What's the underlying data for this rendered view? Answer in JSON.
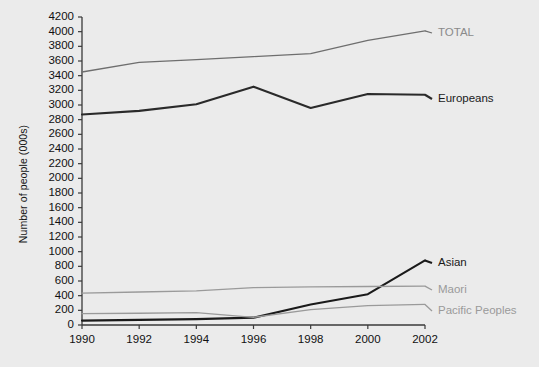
{
  "chart_data": {
    "type": "line",
    "title": "",
    "subtitle": "",
    "xlabel": "",
    "ylabel": "Number of people (000s)",
    "x": [
      1990,
      1991,
      1992,
      1993,
      1994,
      1995,
      1996,
      1997,
      1998,
      1999,
      2000,
      2001,
      2002
    ],
    "categories": [
      "1990",
      "1992",
      "1994",
      "1996",
      "1998",
      "2000",
      "2002"
    ],
    "xticks": [
      "1990",
      "1992",
      "1994",
      "1996",
      "1998",
      "2000",
      "2002"
    ],
    "yticks": [
      "0",
      "200",
      "400",
      "600",
      "800",
      "1000",
      "1200",
      "1400",
      "1600",
      "1800",
      "2000",
      "2200",
      "2400",
      "2600",
      "2800",
      "3000",
      "3200",
      "3400",
      "3600",
      "3800",
      "4000",
      "4200"
    ],
    "xlim": [
      1990,
      2002
    ],
    "ylim": [
      0,
      4200
    ],
    "grid": false,
    "legend_position": "right-inline-labels",
    "series": [
      {
        "name": "TOTAL",
        "color": "#6e6e6e",
        "label_color": "#8a8a8a",
        "x": [
          1990,
          1992,
          1994,
          1996,
          1998,
          2000,
          2002
        ],
        "values": [
          3450,
          3580,
          3620,
          3660,
          3700,
          3880,
          4010
        ]
      },
      {
        "name": "Europeans",
        "color": "#2a2a2a",
        "label_color": "#1a1a1a",
        "x": [
          1990,
          1992,
          1994,
          1996,
          1998,
          2000,
          2002
        ],
        "values": [
          2870,
          2920,
          3010,
          3250,
          2960,
          3150,
          3140
        ]
      },
      {
        "name": "Asian",
        "color": "#1a1a1a",
        "label_color": "#1a1a1a",
        "x": [
          1990,
          1992,
          1994,
          1996,
          1998,
          2000,
          2002
        ],
        "values": [
          60,
          70,
          80,
          100,
          280,
          420,
          880
        ]
      },
      {
        "name": "Maori",
        "color": "#9a9a9a",
        "label_color": "#9a9a9a",
        "x": [
          1990,
          1992,
          1994,
          1996,
          1998,
          2000,
          2002
        ],
        "values": [
          435,
          450,
          465,
          510,
          520,
          525,
          530
        ]
      },
      {
        "name": "Pacific Peoples",
        "color": "#9a9a9a",
        "label_color": "#9a9a9a",
        "x": [
          1990,
          1992,
          1994,
          1996,
          1998,
          2000,
          2002
        ],
        "values": [
          155,
          160,
          170,
          105,
          210,
          265,
          280
        ]
      }
    ]
  },
  "axis": {
    "y_title": "Number of people (000s)"
  },
  "colors": {
    "background": "#ebebeb",
    "axis": "#3a3a3a",
    "dark_series": "#1f1f1f",
    "light_series": "#9a9a9a",
    "mid_series": "#6e6e6e"
  }
}
